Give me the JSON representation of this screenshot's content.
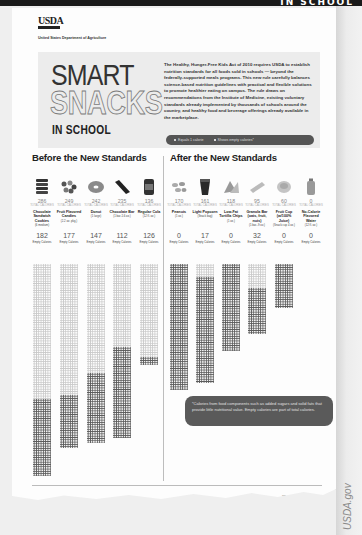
{
  "top_strip": {
    "text": "IN SCHOOL"
  },
  "header": {
    "logo": "USDA",
    "department": "United States Department of Agriculture"
  },
  "hero": {
    "title_line1": "SMART",
    "title_line2": "SNACKS",
    "title_line3": "IN SCHOOL",
    "intro": "The Healthy, Hunger-Free Kids Act of 2010 requires USDA to establish nutrition standards for all foods sold in schools — beyond the federally-supported meals programs. This new rule carefully balances science-based nutrition guidelines with practical and flexible solutions to promote healthier eating on campus. The rule draws on recommendations from the Institute of Medicine, existing voluntary standards already implemented by thousands of schools around the country, and healthy food and beverage offerings already available in the marketplace.",
    "legend": {
      "item1": "Equals 1 calorie",
      "item2": "Shows empty calories*"
    }
  },
  "before": {
    "title": "Before the New Standards",
    "kcal_label": "TOTAL CALORIES",
    "empty_label": "Empty Calories",
    "items": [
      {
        "icon": "cookie-icon",
        "total": "286",
        "name": "Chocolate Sandwich Cookies",
        "serving": "(6 medium)",
        "empty": "182"
      },
      {
        "icon": "candy-icon",
        "total": "249",
        "name": "Fruit Flavored Candies",
        "serving": "(2.2 oz. pkg.)",
        "empty": "177"
      },
      {
        "icon": "donut-icon",
        "total": "242",
        "name": "Donut",
        "serving": "(1 large)",
        "empty": "147"
      },
      {
        "icon": "chocolate-bar-icon",
        "total": "235",
        "name": "Chocolate Bar",
        "serving": "(1 bar-1.6 oz.)",
        "empty": "112"
      },
      {
        "icon": "soda-can-icon",
        "total": "136",
        "name": "Regular Cola",
        "serving": "(12 fl. oz.)",
        "empty": "126"
      }
    ]
  },
  "after": {
    "title": "After the New Standards",
    "kcal_label": "TOTAL CALORIES",
    "empty_label": "Empty Calories",
    "items": [
      {
        "icon": "peanuts-icon",
        "total": "170",
        "name": "Peanuts",
        "serving": "(1 oz.)",
        "empty": "0"
      },
      {
        "icon": "popcorn-icon",
        "total": "161",
        "name": "Light Popcorn",
        "serving": "(Snack bag)",
        "empty": "17"
      },
      {
        "icon": "tortilla-chips-icon",
        "total": "118",
        "name": "Low-Fat Tortilla Chips",
        "serving": "(1 oz.)",
        "empty": "0"
      },
      {
        "icon": "granola-bar-icon",
        "total": "95",
        "name": "Granola Bar (oats, fruit, nuts)",
        "serving": "(1 bar-.9 oz.)",
        "empty": "32"
      },
      {
        "icon": "fruit-cup-icon",
        "total": "60",
        "name": "Fruit Cup (w/100% Juice)",
        "serving": "(Snack cup 4 oz.)",
        "empty": "0"
      },
      {
        "icon": "water-bottle-icon",
        "total": "0",
        "name": "No-Calorie Flavored Water",
        "serving": "(12 fl. oz.)",
        "empty": "0"
      }
    ]
  },
  "footnote": "*Calories from food components such as added sugars and solid fats that provide little nutritional value. Empty calories are part of total calories.",
  "footer": {
    "eo_statement": "USDA is an equal opportunity provider and employer.",
    "campaign_small": "The",
    "campaign_line1": "School Day",
    "campaign_mid": "Just Got",
    "campaign_line2": "Healthier"
  },
  "watermark": "USDA.gov",
  "colors": {
    "dark_dot": "#5a5a5a",
    "light_dot": "#c9c9c9",
    "pill_bg": "#555555",
    "hero_bg": "#ececec"
  }
}
